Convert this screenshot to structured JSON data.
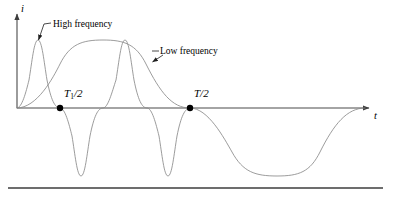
{
  "figure": {
    "axes": {
      "y_label": "i",
      "x_label": "t",
      "origin_x": 17,
      "origin_y": 108,
      "x_axis_end": 371,
      "y_axis_top": 12
    },
    "annotations": [
      {
        "id": "high_frequency",
        "text": "High frequency"
      },
      {
        "id": "low_frequency",
        "text": "Low frequency"
      }
    ],
    "markers": [
      {
        "id": "t1_half",
        "label_html": "T<sub>1</sub>/2",
        "label_plain": "T1/2",
        "x": 60,
        "y": 108
      },
      {
        "id": "t_half",
        "label_html": "T/2",
        "label_plain": "T/2",
        "x": 190,
        "y": 108
      }
    ],
    "colors": {
      "curve": "#8a8a8a",
      "axis": "#4a4a4a",
      "marker": "#000000",
      "text": "#000000",
      "rule": "#3d3d3d",
      "background": "#ffffff"
    }
  },
  "chart_data": {
    "type": "line",
    "title": "",
    "xlabel": "t",
    "ylabel": "i",
    "grid": false,
    "legend": "inline-annotations",
    "xlim": [
      0,
      393
    ],
    "ylim": [
      -70,
      70
    ],
    "series": [
      {
        "name": "High frequency",
        "amplitude": 68,
        "half_period_px": 43,
        "zero_crossings_px": [
          17,
          60,
          103,
          147,
          190
        ],
        "peaks_px": [
          [
            38,
            68
          ],
          [
            125,
            68
          ]
        ],
        "troughs_px": [
          [
            81,
            -68
          ],
          [
            168,
            -68
          ]
        ],
        "phase": "sine, rising from origin",
        "x_start_px": 17,
        "x_end_px": 190
      },
      {
        "name": "Low frequency",
        "amplitude": 68,
        "half_period_px": 173,
        "zero_crossings_px": [
          17,
          190,
          365
        ],
        "peaks_px": [
          [
            103,
            68
          ]
        ],
        "troughs_px": [
          [
            277,
            -68
          ]
        ],
        "phase": "sine, rising from origin",
        "x_start_px": 17,
        "x_end_px": 365
      }
    ],
    "annotations": [
      {
        "text": "High frequency",
        "points_to_px": [
          38,
          41
        ]
      },
      {
        "text": "Low frequency",
        "points_to_px": [
          152,
          62
        ]
      },
      {
        "text": "T1/2",
        "at_px": [
          60,
          108
        ]
      },
      {
        "text": "T/2",
        "at_px": [
          190,
          108
        ]
      }
    ]
  },
  "footer_rule": {
    "visible": true,
    "x_start": 8,
    "x_end": 383,
    "y": 188
  }
}
